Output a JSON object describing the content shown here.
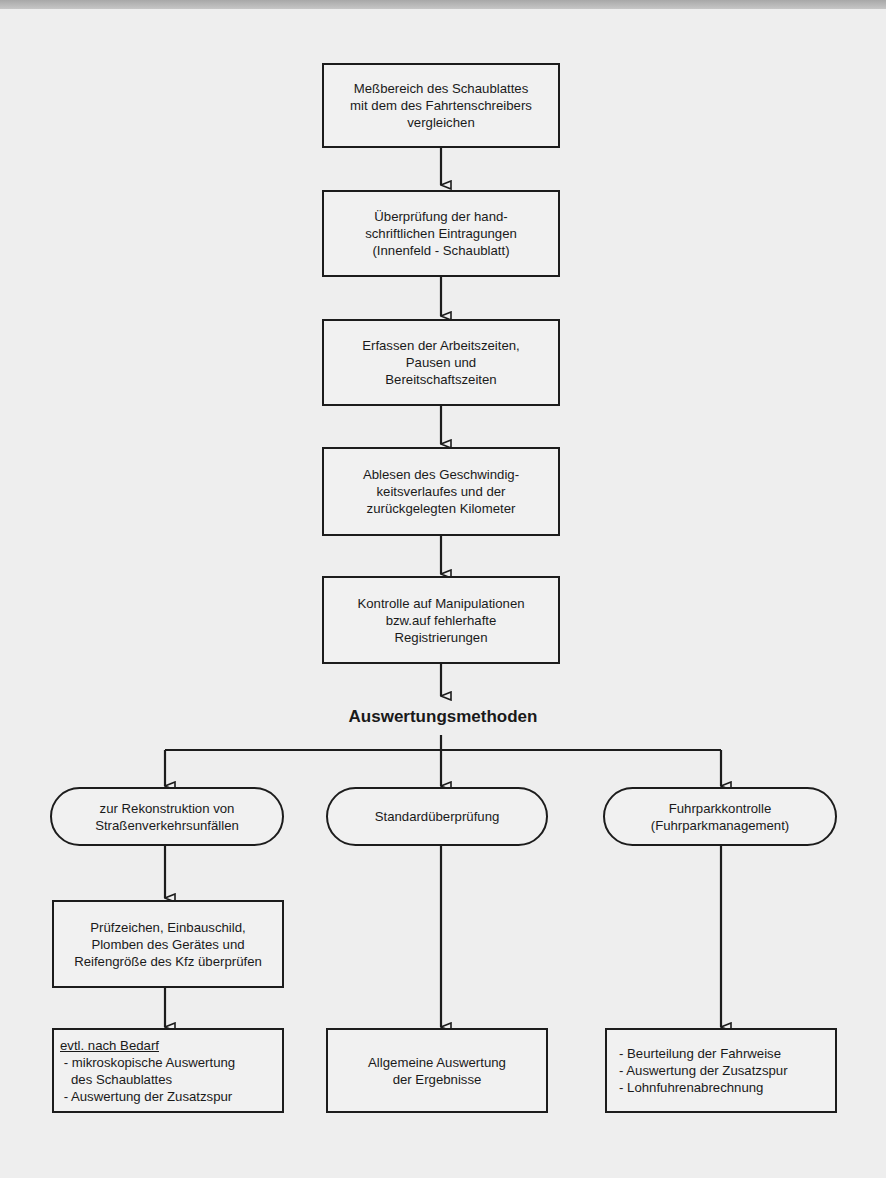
{
  "diagram": {
    "main_steps": [
      {
        "label": "Meßbereich des Schaublattes\nmit dem des Fahrtenschreibers\nvergleichen"
      },
      {
        "label": "Überprüfung der hand-\nschriftlichen Eintragungen\n(Innenfeld - Schaublatt)"
      },
      {
        "label": "Erfassen der Arbeitszeiten,\nPausen und\nBereitschaftszeiten"
      },
      {
        "label": "Ablesen des Geschwindig-\nkeitsverlaufes und der\nzurückgelegten Kilometer"
      },
      {
        "label": "Kontrolle auf Manipulationen\nbzw.auf fehlerhafte\nRegistrierungen"
      }
    ],
    "heading": "Auswertungsmethoden",
    "branches": [
      {
        "method": "zur Rekonstruktion von\nStraßenverkehrsunfällen",
        "step": "Prüfzeichen, Einbauschild,\nPlomben des Gerätes und\nReifengröße des Kfz überprüfen",
        "result_title": "evtl. nach Bedarf",
        "result_lines": " - mikroskopische Auswertung\n   des Schaublattes\n - Auswertung der Zusatzspur"
      },
      {
        "method": "Standardüberprüfung",
        "result": "Allgemeine Auswertung\nder Ergebnisse"
      },
      {
        "method": "Fuhrparkkontrolle\n(Fuhrparkmanagement)",
        "result_lines": "- Beurteilung der Fahrweise\n- Auswertung der Zusatzspur\n- Lohnfuhrenabrechnung"
      }
    ],
    "colors": {
      "line": "#1c1c1c",
      "paper": "#eeeeee",
      "box_fill": "#f1f1f1"
    }
  }
}
